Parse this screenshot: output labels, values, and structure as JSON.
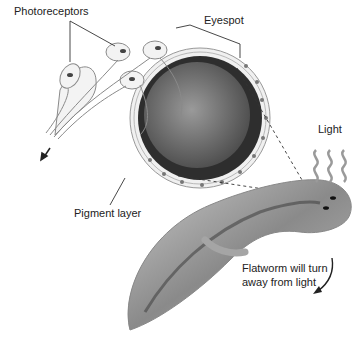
{
  "diagram": {
    "labels": {
      "photoreceptors": "Photoreceptors",
      "eyespot": "Eyespot",
      "pigment_layer": "Pigment layer",
      "light": "Light",
      "caption_line1": "Flatworm will turn",
      "caption_line2": "away from light"
    },
    "colors": {
      "background": "#ffffff",
      "text": "#222222",
      "pigment": "#2e2e2e",
      "cell": "#e6e6e6",
      "worm": "#b5b5b5"
    }
  }
}
